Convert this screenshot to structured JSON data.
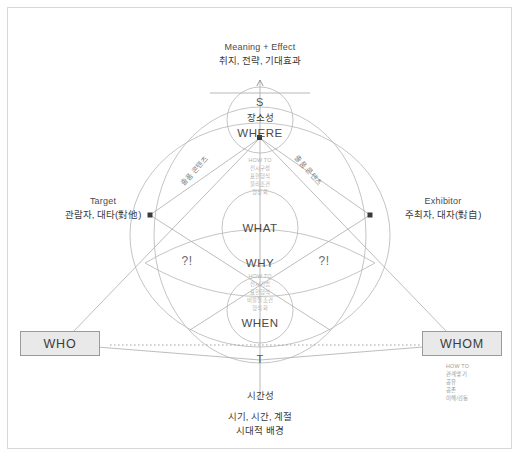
{
  "diagram": {
    "title_en": "Meaning + Effect",
    "title_kr": "취지, 전략, 기대효과",
    "axes": {
      "space_marker": "S",
      "space_kr": "장소성",
      "space_en": "WHERE",
      "time_marker": "T",
      "time_kr": "시간성",
      "time_caption_1": "시기, 시간, 계절",
      "time_caption_2": "시대적 배경"
    },
    "left_node": {
      "en": "Target",
      "kr": "관람자, 대타(對他)",
      "box": "WHO"
    },
    "right_node": {
      "en": "Exhibitor",
      "kr": "주최자, 대자(對自)",
      "box": "WHOM"
    },
    "center": {
      "what": "WHAT",
      "why": "WHY",
      "when": "WHEN",
      "query_left": "?!",
      "query_right": "?!"
    },
    "diagonal_left": "출품 콘텐츠",
    "diagonal_right": "출품 콘텐츠",
    "howto_upper": {
      "head": "HOW TO",
      "lines": [
        "전시구성",
        "표현형식",
        "물리조건",
        "형상화"
      ]
    },
    "howto_lower": {
      "head": "HOW TO",
      "lines": [
        "전시기법",
        "표현형식",
        "비물질조건",
        "형식화"
      ]
    },
    "howto_whom": {
      "head": "HOW TO",
      "lines": [
        "관계맺기",
        "공유",
        "공존",
        "이해/감동"
      ]
    },
    "colors": {
      "line": "#b9b9b9",
      "frame": "#d8d8d8",
      "box_fill": "#e9e9e9",
      "box_border": "#9a9a9a",
      "text": "#3a3a3a",
      "faint": "#b0b0b0"
    }
  }
}
